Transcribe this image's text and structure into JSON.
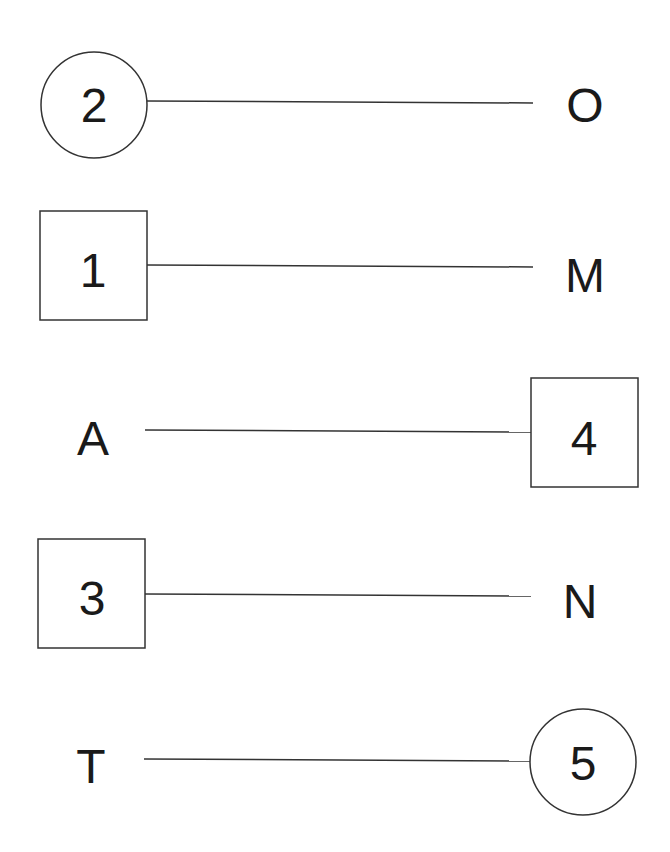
{
  "diagram": {
    "type": "matching-connections",
    "rows": [
      {
        "left": {
          "text": "2",
          "shape": "circle"
        },
        "right": {
          "text": "O",
          "shape": "none"
        }
      },
      {
        "left": {
          "text": "1",
          "shape": "square"
        },
        "right": {
          "text": "M",
          "shape": "none"
        }
      },
      {
        "left": {
          "text": "A",
          "shape": "none"
        },
        "right": {
          "text": "4",
          "shape": "square"
        }
      },
      {
        "left": {
          "text": "3",
          "shape": "square"
        },
        "right": {
          "text": "N",
          "shape": "none"
        }
      },
      {
        "left": {
          "text": "T",
          "shape": "none"
        },
        "right": {
          "text": "5",
          "shape": "circle"
        }
      }
    ],
    "colors": {
      "stroke": "#333333",
      "text": "#1a1a1a",
      "background": "#ffffff"
    }
  }
}
